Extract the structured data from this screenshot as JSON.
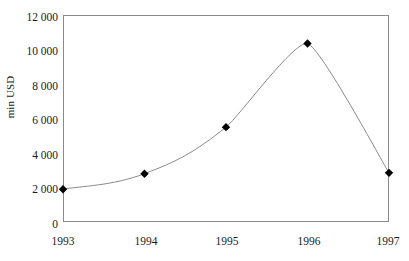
{
  "chart_data": {
    "type": "line",
    "title": "",
    "subtitle": "",
    "xlabel": "",
    "ylabel": "min USD",
    "categories": [
      "1993",
      "1994",
      "1995",
      "1996",
      "1997"
    ],
    "x": [
      1993,
      1994,
      1995,
      1996,
      1997
    ],
    "values": [
      1900,
      2800,
      5500,
      10350,
      2850
    ],
    "series": [
      {
        "name": "min USD",
        "values": [
          1900,
          2800,
          5500,
          10350,
          2850
        ]
      }
    ],
    "ylim": [
      0,
      12000
    ],
    "ytick_values": [
      0,
      2000,
      4000,
      6000,
      8000,
      10000,
      12000
    ],
    "ytick_labels": [
      "0",
      "2 000",
      "4 000",
      "6 000",
      "8 000",
      "10 000",
      "12 000"
    ],
    "xtick_labels": [
      "1993",
      "1994",
      "1995",
      "1996",
      "1997"
    ],
    "grid": false,
    "legend": false,
    "legend_position": "none",
    "marker": "diamond",
    "marker_color": "#000000",
    "line_color": "#8a8a8a",
    "frame_color": "#8a8a8a",
    "background_color": "#ffffff",
    "text_color": "#1a1a1a",
    "annotations": []
  },
  "axis": {
    "y_title": "min USD"
  }
}
